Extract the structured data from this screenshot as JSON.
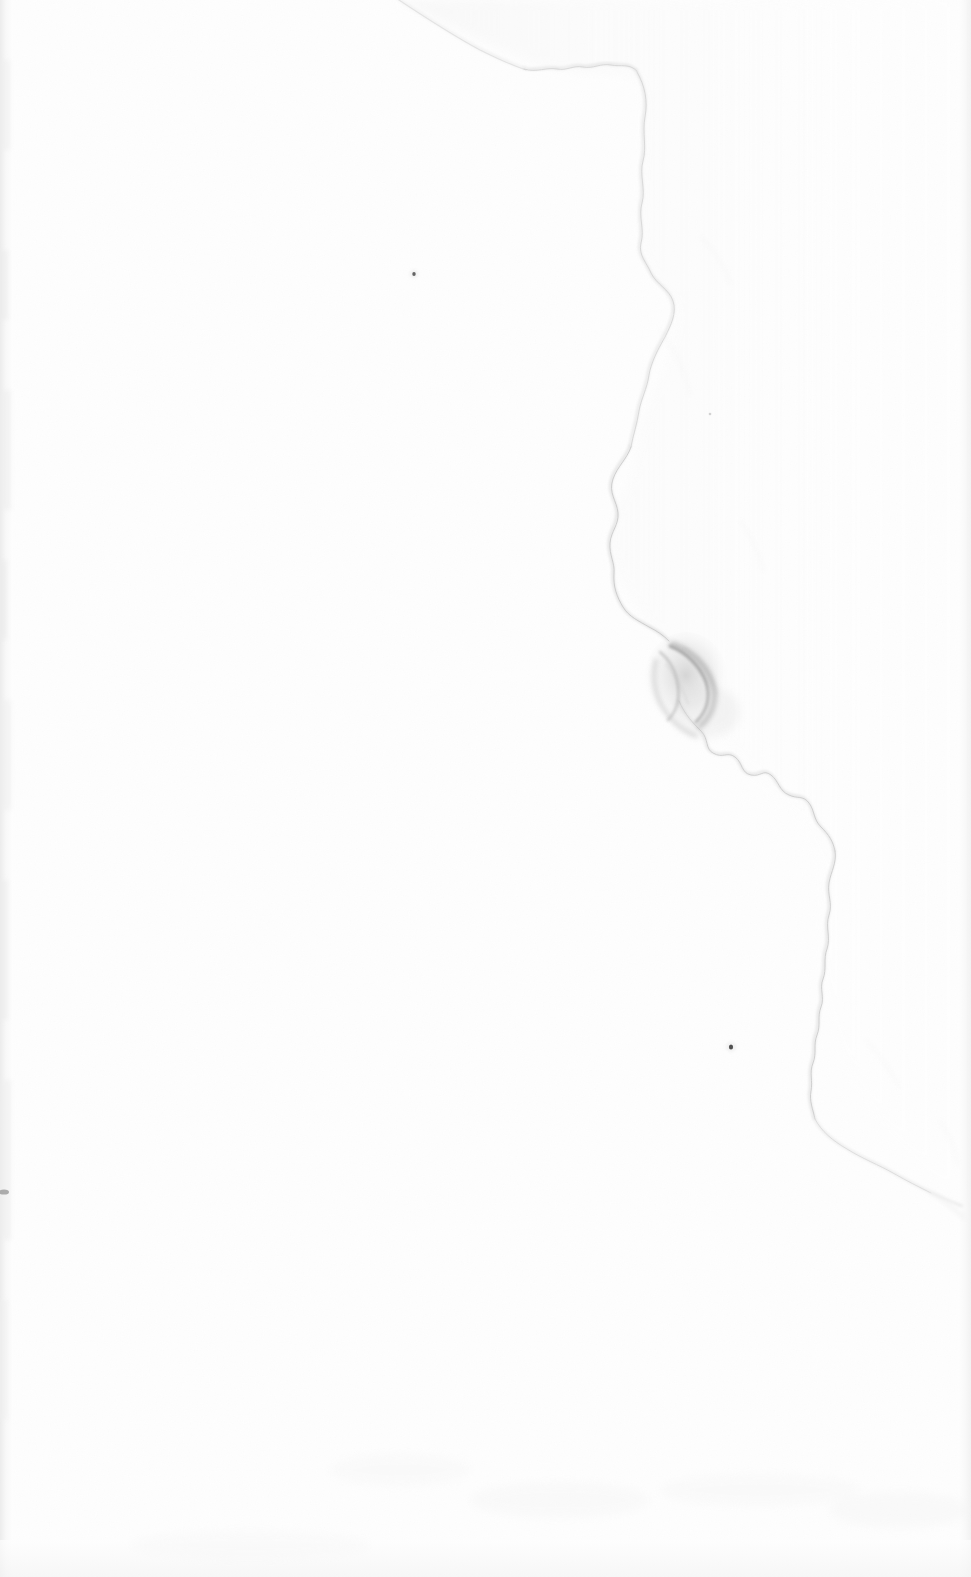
{
  "page": {
    "width": 971,
    "height": 1577,
    "background_color": "#fefefe",
    "description": "A scanned blank sheet of paper: almost entirely white with a faint meandering tonal edge running from the top edge down toward the lower right, a darker crescent-shaped crease smudge at mid right, a few small dust specks, and faint scan-edge bands along the left and right borders.",
    "visible_text": ""
  },
  "colors": {
    "paper": "#fefefe",
    "paper_shade": "#fafafa",
    "faint_line": "#e6e6e6",
    "mid_line": "#d2d2d2",
    "smudge_dark": "#9a9a9a",
    "speck_dark": "#2e2e2e",
    "edge_band": "#f2f2f2"
  },
  "features": [
    {
      "name": "faint-curved-edge",
      "kind": "tonal-boundary",
      "stroke": "#e2e2e2",
      "note": "Wavy scalloped boundary entering at the top edge near x=395 and exiting near the right edge at about y=1195."
    },
    {
      "name": "crease-smudge",
      "kind": "crescent-shadow",
      "center_x": 682,
      "center_y": 678,
      "stroke": "#9a9a9a",
      "note": "Darkest feature on the page; a hooked crescent fold shadow."
    },
    {
      "name": "dust-speck-upper",
      "kind": "speck",
      "x": 414,
      "y": 274,
      "radius": 1.6,
      "color": "#3a3a3a"
    },
    {
      "name": "dust-speck-middle",
      "kind": "speck",
      "x": 710,
      "y": 414,
      "radius": 1.2,
      "color": "#c8c8c8"
    },
    {
      "name": "dust-speck-lower",
      "kind": "speck",
      "x": 731,
      "y": 1047,
      "radius": 2.2,
      "color": "#2e2e2e"
    },
    {
      "name": "edge-mark-left",
      "kind": "smudge",
      "x": 4,
      "y": 1192,
      "color": "#8f8f8f"
    },
    {
      "name": "scan-edge-band-left",
      "kind": "band",
      "x": 0,
      "width": 12,
      "color": "#f4f4f4"
    },
    {
      "name": "scan-edge-band-right",
      "kind": "band",
      "x": 959,
      "width": 12,
      "color": "#f6f6f6"
    }
  ]
}
